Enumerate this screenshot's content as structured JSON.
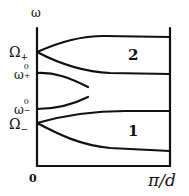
{
  "diagram": {
    "type": "dispersion-diagram",
    "axis": {
      "y_label": "ω",
      "x_origin": "0",
      "x_end": "π/d"
    },
    "levels": [
      {
        "id": "Omega_plus",
        "label": "Ω",
        "sub": "+"
      },
      {
        "id": "omega0_plus",
        "label": "ω",
        "sup": "0",
        "sub": "+"
      },
      {
        "id": "omega0_minus",
        "label": "ω",
        "sup": "0",
        "sub": "−"
      },
      {
        "id": "Omega_minus",
        "label": "Ω",
        "sub": "−"
      }
    ],
    "bands": [
      {
        "label": "2"
      },
      {
        "label": "1"
      }
    ],
    "colors": {
      "line": "#111111",
      "background": "#ffffff"
    }
  }
}
